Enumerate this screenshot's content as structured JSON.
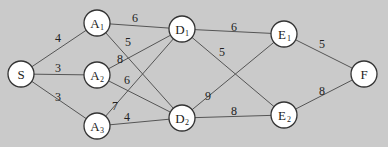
{
  "diagram": {
    "type": "weighted-network",
    "background": "#cacaca",
    "nodes": [
      {
        "id": "S",
        "label": "S",
        "sub": "",
        "x": 21,
        "y": 74
      },
      {
        "id": "A1",
        "label": "A",
        "sub": "1",
        "x": 97,
        "y": 23
      },
      {
        "id": "A2",
        "label": "A",
        "sub": "2",
        "x": 97,
        "y": 75
      },
      {
        "id": "A3",
        "label": "A",
        "sub": "3",
        "x": 97,
        "y": 126
      },
      {
        "id": "D1",
        "label": "D",
        "sub": "1",
        "x": 182,
        "y": 29
      },
      {
        "id": "D2",
        "label": "D",
        "sub": "2",
        "x": 182,
        "y": 118
      },
      {
        "id": "E1",
        "label": "E",
        "sub": "1",
        "x": 284,
        "y": 34
      },
      {
        "id": "E2",
        "label": "E",
        "sub": "2",
        "x": 284,
        "y": 115
      },
      {
        "id": "F",
        "label": "F",
        "sub": "",
        "x": 364,
        "y": 74
      }
    ],
    "edges": [
      {
        "from": "S",
        "to": "A1",
        "weight": "4",
        "lx": 58,
        "ly": 42
      },
      {
        "from": "S",
        "to": "A2",
        "weight": "3",
        "lx": 58,
        "ly": 72
      },
      {
        "from": "S",
        "to": "A3",
        "weight": "3",
        "lx": 58,
        "ly": 101
      },
      {
        "from": "A1",
        "to": "D1",
        "weight": "6",
        "lx": 135,
        "ly": 22
      },
      {
        "from": "A1",
        "to": "D2",
        "weight": "5",
        "lx": 128,
        "ly": 46
      },
      {
        "from": "A2",
        "to": "D1",
        "weight": "8",
        "lx": 120,
        "ly": 63
      },
      {
        "from": "A2",
        "to": "D2",
        "weight": "6",
        "lx": 127,
        "ly": 84
      },
      {
        "from": "A3",
        "to": "D1",
        "weight": "7",
        "lx": 115,
        "ly": 110
      },
      {
        "from": "A3",
        "to": "D2",
        "weight": "4",
        "lx": 127,
        "ly": 121
      },
      {
        "from": "D1",
        "to": "E1",
        "weight": "6",
        "lx": 234,
        "ly": 31
      },
      {
        "from": "D1",
        "to": "E2",
        "weight": "5",
        "lx": 222,
        "ly": 56
      },
      {
        "from": "D2",
        "to": "E1",
        "weight": "9",
        "lx": 208,
        "ly": 100
      },
      {
        "from": "D2",
        "to": "E2",
        "weight": "8",
        "lx": 234,
        "ly": 115
      },
      {
        "from": "E1",
        "to": "F",
        "weight": "5",
        "lx": 322,
        "ly": 48
      },
      {
        "from": "E2",
        "to": "F",
        "weight": "8",
        "lx": 322,
        "ly": 95
      }
    ]
  }
}
